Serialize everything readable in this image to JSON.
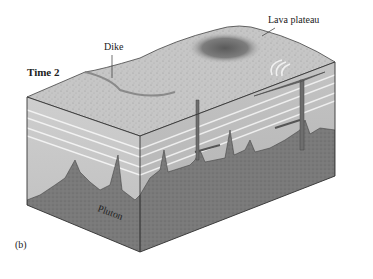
{
  "figure": {
    "panel_label": "(b)",
    "stage_title": "Time 2",
    "labels": {
      "dike": "Dike",
      "lava_plateau": "Lava plateau",
      "pluton": "Pluton"
    },
    "colors": {
      "top_surface": "#c9c9c9",
      "lava_dark": "#6a6a6a",
      "strata_light": "#d6d6d6",
      "strata_mid": "#bdbdbd",
      "intrusion": "#7a7a7a",
      "outline": "#333333"
    }
  }
}
